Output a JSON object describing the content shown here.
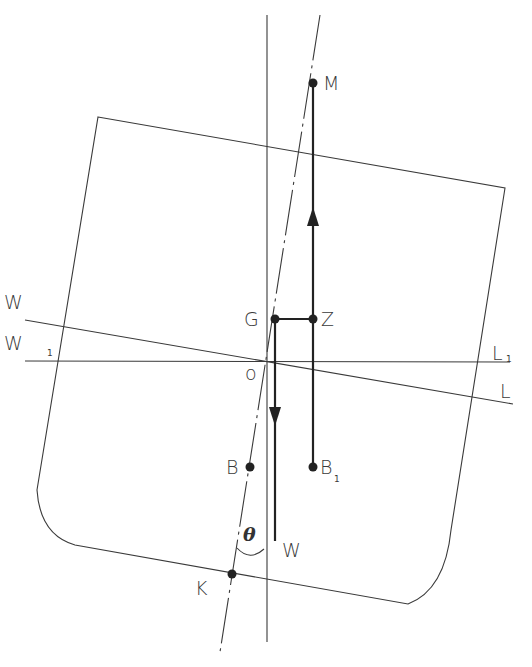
{
  "figure": {
    "colors": {
      "line": "#3a3a3a",
      "force": "#222222",
      "background": "#ffffff"
    }
  },
  "labels": {
    "M": "M",
    "G": "G",
    "Z": "Z",
    "W": "W",
    "W1": "W",
    "W1_sub": "1",
    "L": "L",
    "L1": "L",
    "L1_sub": "1",
    "O": "o",
    "B": "B",
    "B1": "B",
    "B1_sub": "1",
    "weight": "W",
    "K": "K",
    "theta": "θ"
  },
  "points": {
    "M": [
      313,
      83
    ],
    "G": [
      275,
      319
    ],
    "Z": [
      313,
      319
    ],
    "O": [
      268,
      361
    ],
    "B": [
      250,
      467
    ],
    "B1": [
      313,
      467
    ],
    "K": [
      232,
      574
    ]
  }
}
